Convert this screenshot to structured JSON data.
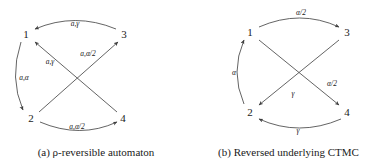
{
  "figure": {
    "panels": [
      {
        "id": "a",
        "caption_prefix": "(a)",
        "caption_symbol": "ρ",
        "caption_text": "-reversible automaton",
        "caption_full": "(a) ρ-reversible automaton",
        "nodes": [
          {
            "id": "n1",
            "label": "1",
            "x": 26,
            "y": 34
          },
          {
            "id": "n3",
            "label": "3",
            "x": 124,
            "y": 34
          },
          {
            "id": "n2",
            "label": "2",
            "x": 31,
            "y": 118
          },
          {
            "id": "n4",
            "label": "4",
            "x": 123,
            "y": 118
          }
        ],
        "edges": [
          {
            "id": "e-3-1",
            "from": "3",
            "to": "1",
            "label": "a,γ",
            "label_x": 75,
            "label_y": 24
          },
          {
            "id": "e-1-2",
            "from": "1",
            "to": "2",
            "label": "a,α",
            "label_x": 24,
            "label_y": 78
          },
          {
            "id": "e-4-1",
            "from": "4",
            "to": "1",
            "label": "a,γ",
            "label_x": 50,
            "label_y": 62
          },
          {
            "id": "e-2-3",
            "from": "2",
            "to": "3",
            "label": "a,α/2",
            "label_x": 88,
            "label_y": 54
          },
          {
            "id": "e-2-4",
            "from": "2",
            "to": "4",
            "label": "a,α/2",
            "label_x": 77,
            "label_y": 127
          }
        ]
      },
      {
        "id": "b",
        "caption_prefix": "(b)",
        "caption_symbol": "",
        "caption_text": "Reversed underlying CTMC",
        "caption_full": "(b) Reversed underlying CTMC",
        "nodes": [
          {
            "id": "n1",
            "label": "1",
            "x": 58,
            "y": 32
          },
          {
            "id": "n3",
            "label": "3",
            "x": 155,
            "y": 32
          },
          {
            "id": "n2",
            "label": "2",
            "x": 58,
            "y": 112
          },
          {
            "id": "n4",
            "label": "4",
            "x": 155,
            "y": 112
          }
        ],
        "edges": [
          {
            "id": "e-1-3",
            "from": "1",
            "to": "3",
            "label": "α/2",
            "label_x": 109,
            "label_y": 13
          },
          {
            "id": "e-2-1",
            "from": "2",
            "to": "1",
            "label": "α",
            "label_x": 42,
            "label_y": 73
          },
          {
            "id": "e-1-4",
            "from": "1",
            "to": "4",
            "label": "α/2",
            "label_x": 140,
            "label_y": 84
          },
          {
            "id": "e-3-2",
            "from": "3",
            "to": "2",
            "label": "γ",
            "label_x": 101,
            "label_y": 94
          },
          {
            "id": "e-4-2",
            "from": "4",
            "to": "2",
            "label": "γ",
            "label_x": 106,
            "label_y": 131
          }
        ]
      }
    ]
  },
  "colors": {
    "stroke": "#3c3c3c",
    "text": "#1a1a1a",
    "background": "#ffffff"
  }
}
